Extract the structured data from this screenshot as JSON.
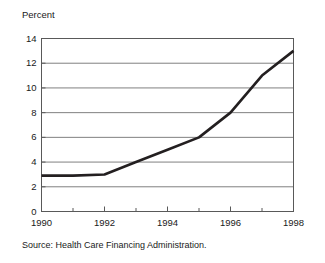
{
  "figure": {
    "axis_title": "Percent",
    "source_note": "Source: Health Care Financing Administration."
  },
  "chart_data": {
    "type": "line",
    "title": "",
    "subtitle": "",
    "xlabel": "",
    "ylabel": "Percent",
    "x": [
      1990,
      1991,
      1992,
      1993,
      1994,
      1995,
      1996,
      1997,
      1998
    ],
    "values": [
      2.9,
      2.9,
      3.0,
      4.0,
      5.0,
      6.0,
      8.0,
      11.0,
      13.0
    ],
    "series": [
      {
        "name": "Percent",
        "values": [
          2.9,
          2.9,
          3.0,
          4.0,
          5.0,
          6.0,
          8.0,
          11.0,
          13.0
        ],
        "color": "#231f20"
      }
    ],
    "xlim": [
      1990,
      1998
    ],
    "ylim": [
      0,
      14
    ],
    "y_ticks": [
      0,
      2,
      4,
      6,
      8,
      10,
      12,
      14
    ],
    "y_tick_labels": [
      "0",
      "2",
      "4",
      "6",
      "8",
      "10",
      "12",
      "14"
    ],
    "x_ticks": [
      1990,
      1991,
      1992,
      1993,
      1994,
      1995,
      1996,
      1997,
      1998
    ],
    "x_tick_labels": [
      "1990",
      "",
      "1992",
      "",
      "1994",
      "",
      "1996",
      "",
      "1998"
    ],
    "x_major_labels": [
      "1990",
      "1992",
      "1994",
      "1996",
      "1998"
    ],
    "grid": "horizontal",
    "grid_color": "#808080",
    "frame_color": "#595959",
    "legend": "none",
    "annotations": [],
    "source": "Source: Health Care Financing Administration."
  }
}
